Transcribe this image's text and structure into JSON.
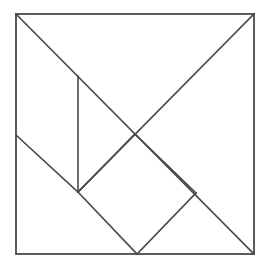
{
  "figure": {
    "name": "tangram-dissection",
    "background_color": "#ffffff",
    "line_color": "#4a4a4a",
    "stroke_width": 1.6,
    "canvas": {
      "width": 270,
      "height": 269
    }
  },
  "square": {
    "left": 16,
    "top": 14,
    "right": 254,
    "bottom": 254,
    "width": 238,
    "height": 240
  },
  "points": {
    "top_left": {
      "x": 16,
      "y": 14
    },
    "top_right": {
      "x": 254,
      "y": 14
    },
    "bottom_right": {
      "x": 254,
      "y": 254
    },
    "bottom_left": {
      "x": 16,
      "y": 254
    },
    "left_mid": {
      "x": 16,
      "y": 135
    },
    "bottom_mid": {
      "x": 137,
      "y": 254
    },
    "center": {
      "x": 135,
      "y": 134
    },
    "vertical_top": {
      "x": 78,
      "y": 76
    },
    "junction_low_left": {
      "x": 78,
      "y": 192
    },
    "junction_low_right": {
      "x": 196,
      "y": 193
    }
  },
  "segments": [
    {
      "name": "border-top",
      "x1": 16,
      "y1": 14,
      "x2": 254,
      "y2": 14
    },
    {
      "name": "border-right",
      "x1": 254,
      "y1": 14,
      "x2": 254,
      "y2": 254
    },
    {
      "name": "border-bottom",
      "x1": 254,
      "y1": 254,
      "x2": 16,
      "y2": 254
    },
    {
      "name": "border-left",
      "x1": 16,
      "y1": 254,
      "x2": 16,
      "y2": 14
    },
    {
      "name": "main-diagonal",
      "x1": 16,
      "y1": 14,
      "x2": 254,
      "y2": 254
    },
    {
      "name": "anti-diagonal",
      "x1": 254,
      "y1": 14,
      "x2": 78,
      "y2": 192
    },
    {
      "name": "vertical-divider",
      "x1": 78,
      "y1": 76,
      "x2": 78,
      "y2": 192
    },
    {
      "name": "left-mid-to-junction",
      "x1": 16,
      "y1": 135,
      "x2": 78,
      "y2": 192
    },
    {
      "name": "junction-to-bottom-mid",
      "x1": 78,
      "y1": 192,
      "x2": 137,
      "y2": 254
    },
    {
      "name": "junction-to-center",
      "x1": 78,
      "y1": 192,
      "x2": 135,
      "y2": 134
    },
    {
      "name": "center-to-junction-r",
      "x1": 135,
      "y1": 134,
      "x2": 196,
      "y2": 193
    },
    {
      "name": "bottom-mid-to-junction-r",
      "x1": 137,
      "y1": 254,
      "x2": 196,
      "y2": 193
    }
  ],
  "pieces": [
    {
      "name": "large-triangle-upper-right",
      "label": "Large Triangle 1"
    },
    {
      "name": "large-triangle-lower-right",
      "label": "Large Triangle 2"
    },
    {
      "name": "medium-triangle-left",
      "label": "Medium Triangle"
    },
    {
      "name": "small-triangle-upper",
      "label": "Small Triangle 1"
    },
    {
      "name": "small-triangle-lower",
      "label": "Small Triangle 2"
    },
    {
      "name": "square-piece",
      "label": "Square"
    },
    {
      "name": "parallelogram-piece",
      "label": "Parallelogram"
    }
  ]
}
